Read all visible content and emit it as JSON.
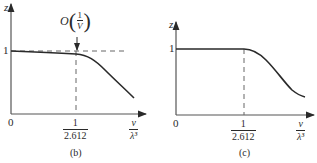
{
  "figures": [
    {
      "id": "b",
      "caption": "(b)",
      "y_axis_label": "z",
      "x_axis_label": {
        "numerator": "v",
        "denominator": "λ³"
      },
      "origin_label": "0",
      "y_tick_label": "1",
      "x_tick_label": {
        "numerator": "1",
        "denominator": "2.612"
      },
      "annotation": {
        "prefix": "O",
        "numerator": "1",
        "denominator": "V"
      },
      "has_horizontal_dashed_reference": true,
      "has_vertical_dashed_reference": true,
      "has_arrow_annotation": true
    },
    {
      "id": "c",
      "caption": "(c)",
      "y_axis_label": "z",
      "x_axis_label": {
        "numerator": "v",
        "denominator": "λ³"
      },
      "origin_label": "0",
      "y_tick_label": "1",
      "x_tick_label": {
        "numerator": "1",
        "denominator": "2.612"
      },
      "has_horizontal_dashed_reference": false,
      "has_vertical_dashed_reference": true,
      "has_arrow_annotation": false
    }
  ],
  "colors": {
    "line": "#2a2a2a",
    "axis": "#555555",
    "dash": "#666666"
  }
}
